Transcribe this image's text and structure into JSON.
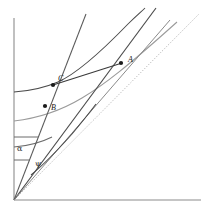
{
  "figure": {
    "type": "geometric-diagram",
    "background_color": "#ffffff",
    "width": 211,
    "height": 214,
    "axes": {
      "color": "#8c8c8c",
      "origin": [
        14,
        200
      ],
      "y_axis_top": [
        14,
        18
      ],
      "x_axis_right": [
        201,
        200
      ]
    },
    "point_labels": [
      {
        "name": "A",
        "text": "A",
        "x": 128,
        "y": 61,
        "dot": [
          121,
          63
        ]
      },
      {
        "name": "C",
        "text": "C",
        "x": 59,
        "y": 80,
        "dot": [
          53,
          85
        ]
      },
      {
        "name": "B",
        "text": "B",
        "x": 52,
        "y": 109,
        "dot": [
          45,
          106
        ]
      }
    ],
    "greek_labels": [
      {
        "name": "alpha",
        "text": "α",
        "x": 17,
        "y": 148
      },
      {
        "name": "psi",
        "text": "ψ",
        "x": 35,
        "y": 164
      }
    ],
    "curves": [
      {
        "name": "upper-dark-curve",
        "color": "#3a3a3a"
      },
      {
        "name": "middle-gray-curve",
        "color": "#8a8a8a"
      },
      {
        "name": "lower-dark-curve",
        "color": "#5a5a5a"
      },
      {
        "name": "small-psi-arc",
        "color": "#4a4a4a"
      }
    ],
    "rays": [
      {
        "name": "steep-ray-through-B-C",
        "color": "#4a4a4a"
      },
      {
        "name": "ray-through-A",
        "color": "#3a3a3a"
      },
      {
        "name": "dotted-diagonal-ray",
        "color": "#b0b0b0",
        "style": "dotted"
      }
    ],
    "segments": [
      {
        "name": "chord-C-to-A",
        "color": "#3a3a3a"
      },
      {
        "name": "tick-alpha-upper",
        "color": "#6a6a6a"
      },
      {
        "name": "tick-alpha-lower",
        "color": "#6a6a6a"
      }
    ]
  }
}
